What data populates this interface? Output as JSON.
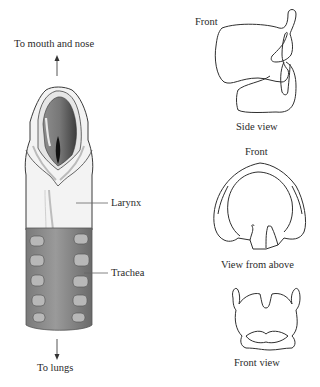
{
  "diagram": {
    "left": {
      "top_label": "To mouth and nose",
      "bottom_label": "To lungs",
      "callouts": {
        "larynx": "Larynx",
        "trachea": "Trachea"
      }
    },
    "right": {
      "side_view": {
        "front_label": "Front",
        "caption": "Side view"
      },
      "above_view": {
        "front_label": "Front",
        "caption": "View from above"
      },
      "front_view": {
        "caption": "Front view"
      }
    },
    "colors": {
      "outline": "#333333",
      "cartilage_light": "#f2f2f2",
      "mucosa_dark": "#6e6e6e",
      "trachea_gray": "#8a8a8a",
      "ring_light": "#b9b9b9"
    }
  }
}
